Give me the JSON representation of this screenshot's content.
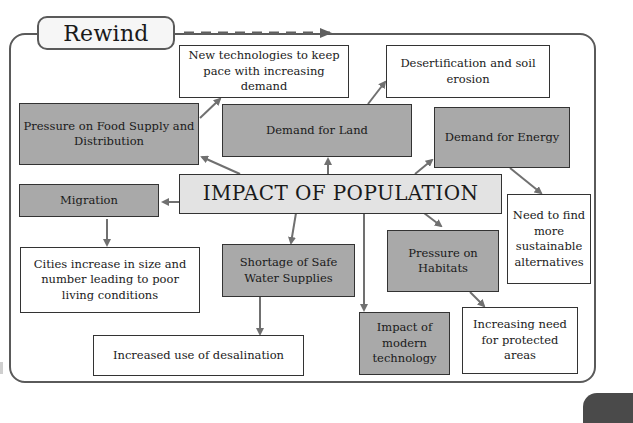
{
  "header": {
    "rewind_label": "Rewind"
  },
  "diagram": {
    "center": "IMPACT OF POPULATION",
    "impacts": {
      "food": "Pressure on Food Supply and Distribution",
      "land": "Demand for Land",
      "energy": "Demand for Energy",
      "migration": "Migration",
      "water": "Shortage of Safe Water Supplies",
      "technology": "Impact of modern technology",
      "habitats": "Pressure on Habitats"
    },
    "consequences": {
      "food": "New technologies to keep pace with increasing demand",
      "land": "Desertification and soil erosion",
      "energy": "Need to find more sustainable alternatives",
      "migration": "Cities increase in size and number leading to poor living conditions",
      "water": "Increased use of desalination",
      "habitats": "Increasing need for protected areas"
    }
  },
  "colors": {
    "impact_box": "#a9a9a9",
    "center_box": "#e3e3e3",
    "consequence_box": "#ffffff",
    "lines": "#707070",
    "frame": "#5a5a5a"
  }
}
